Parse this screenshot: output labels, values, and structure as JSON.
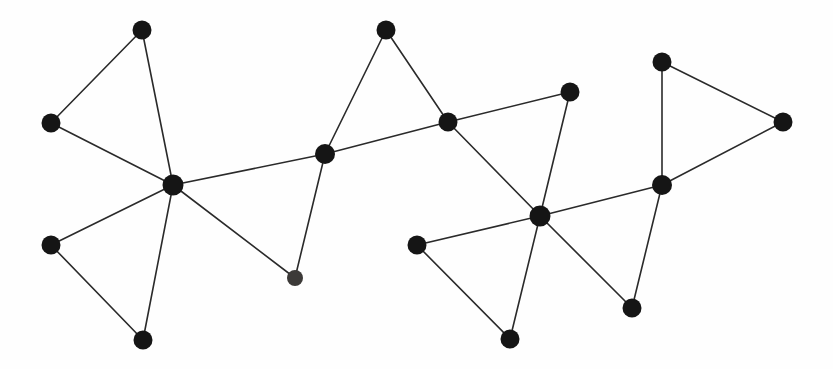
{
  "figure": {
    "kind": "node-link-graph",
    "background_color": "#fefefe",
    "width": 833,
    "height": 369
  },
  "style": {
    "node_color": "#151515",
    "node_color_alt": "#3c3a38",
    "edge_color": "#2a2a2a",
    "edge_width": 1.6,
    "node_radius": 9.5,
    "node_radius_small": 8.0
  },
  "graph": {
    "node_count": 18,
    "edge_count": 22,
    "nodes": [
      {
        "id": "n1",
        "name": "node-top-left",
        "x": 142,
        "y": 30,
        "r": 9.5,
        "color": "#151515"
      },
      {
        "id": "n2",
        "name": "node-left-upper",
        "x": 51,
        "y": 123,
        "r": 9.5,
        "color": "#151515"
      },
      {
        "id": "n3",
        "name": "node-hub-left",
        "x": 173,
        "y": 185,
        "r": 10.5,
        "color": "#151515"
      },
      {
        "id": "n4",
        "name": "node-left-lower",
        "x": 51,
        "y": 245,
        "r": 9.5,
        "color": "#151515"
      },
      {
        "id": "n5",
        "name": "node-bottom-left",
        "x": 143,
        "y": 340,
        "r": 9.5,
        "color": "#151515"
      },
      {
        "id": "n6",
        "name": "node-top-center",
        "x": 386,
        "y": 30,
        "r": 9.5,
        "color": "#151515"
      },
      {
        "id": "n7",
        "name": "node-center-junction",
        "x": 325,
        "y": 154,
        "r": 10.0,
        "color": "#151515"
      },
      {
        "id": "n8",
        "name": "node-center-lower",
        "x": 295,
        "y": 278,
        "r": 8.0,
        "color": "#3c3a38"
      },
      {
        "id": "n9",
        "name": "node-center-right-upper",
        "x": 448,
        "y": 122,
        "r": 9.5,
        "color": "#151515"
      },
      {
        "id": "n10",
        "name": "node-upper-right-spur",
        "x": 570,
        "y": 92,
        "r": 9.5,
        "color": "#151515"
      },
      {
        "id": "n11",
        "name": "node-hub-right",
        "x": 540,
        "y": 216,
        "r": 10.5,
        "color": "#151515"
      },
      {
        "id": "n12",
        "name": "node-right-left-spur",
        "x": 417,
        "y": 245,
        "r": 9.5,
        "color": "#151515"
      },
      {
        "id": "n13",
        "name": "node-bottom-center",
        "x": 510,
        "y": 339,
        "r": 9.5,
        "color": "#151515"
      },
      {
        "id": "n14",
        "name": "node-bottom-right",
        "x": 632,
        "y": 308,
        "r": 9.5,
        "color": "#151515"
      },
      {
        "id": "n15",
        "name": "node-right-junction",
        "x": 662,
        "y": 185,
        "r": 10.0,
        "color": "#151515"
      },
      {
        "id": "n16",
        "name": "node-right-top",
        "x": 662,
        "y": 62,
        "r": 9.5,
        "color": "#151515"
      },
      {
        "id": "n17",
        "name": "node-far-right",
        "x": 783,
        "y": 122,
        "r": 9.5,
        "color": "#151515"
      }
    ],
    "edges": [
      {
        "name": "edge-n1-n2",
        "from": "n1",
        "to": "n2"
      },
      {
        "name": "edge-n1-n3",
        "from": "n1",
        "to": "n3"
      },
      {
        "name": "edge-n2-n3",
        "from": "n2",
        "to": "n3"
      },
      {
        "name": "edge-n3-n4",
        "from": "n3",
        "to": "n4"
      },
      {
        "name": "edge-n3-n5",
        "from": "n3",
        "to": "n5"
      },
      {
        "name": "edge-n4-n5",
        "from": "n4",
        "to": "n5"
      },
      {
        "name": "edge-n3-n7",
        "from": "n3",
        "to": "n7"
      },
      {
        "name": "edge-n3-n8",
        "from": "n3",
        "to": "n8"
      },
      {
        "name": "edge-n6-n7",
        "from": "n6",
        "to": "n7"
      },
      {
        "name": "edge-n6-n9",
        "from": "n6",
        "to": "n9"
      },
      {
        "name": "edge-n7-n8",
        "from": "n7",
        "to": "n8"
      },
      {
        "name": "edge-n7-n9",
        "from": "n7",
        "to": "n9"
      },
      {
        "name": "edge-n9-n10",
        "from": "n9",
        "to": "n10"
      },
      {
        "name": "edge-n9-n11",
        "from": "n9",
        "to": "n11"
      },
      {
        "name": "edge-n10-n11",
        "from": "n10",
        "to": "n11"
      },
      {
        "name": "edge-n11-n12",
        "from": "n11",
        "to": "n12"
      },
      {
        "name": "edge-n11-n13",
        "from": "n11",
        "to": "n13"
      },
      {
        "name": "edge-n12-n13",
        "from": "n12",
        "to": "n13"
      },
      {
        "name": "edge-n11-n14",
        "from": "n11",
        "to": "n14"
      },
      {
        "name": "edge-n11-n15",
        "from": "n11",
        "to": "n15"
      },
      {
        "name": "edge-n14-n15",
        "from": "n14",
        "to": "n15"
      },
      {
        "name": "edge-n15-n16",
        "from": "n15",
        "to": "n16"
      },
      {
        "name": "edge-n15-n17",
        "from": "n15",
        "to": "n17"
      },
      {
        "name": "edge-n16-n17",
        "from": "n16",
        "to": "n17"
      }
    ]
  }
}
